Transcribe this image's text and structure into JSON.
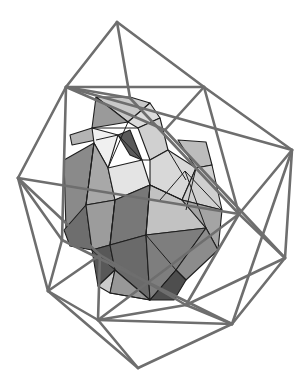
{
  "figure": {
    "background": "#ffffff",
    "wire_color": "#6e6e6e",
    "edge_color": "#1e1e1e"
  },
  "wireframe": {
    "vertices": {
      "A": [
        117,
        22
      ],
      "B": [
        66,
        87
      ],
      "C": [
        204,
        87
      ],
      "D": [
        292,
        150
      ],
      "E": [
        18,
        178
      ],
      "F": [
        239,
        214
      ],
      "G": [
        285,
        258
      ],
      "H": [
        48,
        291
      ],
      "I": [
        98,
        320
      ],
      "J": [
        186,
        305
      ],
      "K": [
        232,
        324
      ],
      "L": [
        138,
        368
      ],
      "P": [
        130,
        98
      ],
      "Q": [
        165,
        130
      ],
      "R": [
        62,
        240
      ],
      "S": [
        100,
        255
      ]
    },
    "edges": [
      [
        "A",
        "B"
      ],
      [
        "A",
        "C"
      ],
      [
        "A",
        "P"
      ],
      [
        "B",
        "C"
      ],
      [
        "C",
        "D"
      ],
      [
        "B",
        "E"
      ],
      [
        "B",
        "P"
      ],
      [
        "B",
        "Q"
      ],
      [
        "C",
        "Q"
      ],
      [
        "C",
        "F"
      ],
      [
        "D",
        "F"
      ],
      [
        "D",
        "G"
      ],
      [
        "D",
        "K"
      ],
      [
        "E",
        "H"
      ],
      [
        "E",
        "R"
      ],
      [
        "B",
        "R"
      ],
      [
        "E",
        "S"
      ],
      [
        "H",
        "I"
      ],
      [
        "H",
        "L"
      ],
      [
        "H",
        "S"
      ],
      [
        "I",
        "J"
      ],
      [
        "I",
        "K"
      ],
      [
        "J",
        "K"
      ],
      [
        "J",
        "G"
      ],
      [
        "K",
        "L"
      ],
      [
        "I",
        "L"
      ],
      [
        "G",
        "K"
      ],
      [
        "F",
        "G"
      ],
      [
        "F",
        "I"
      ],
      [
        "F",
        "J"
      ],
      [
        "R",
        "H"
      ],
      [
        "S",
        "J"
      ],
      [
        "Q",
        "G"
      ],
      [
        "P",
        "F"
      ],
      [
        "B",
        "D"
      ],
      [
        "E",
        "F"
      ],
      [
        "R",
        "K"
      ],
      [
        "S",
        "I"
      ]
    ]
  },
  "inner": {
    "facets": [
      {
        "pts": [
          [
            96,
            97
          ],
          [
            130,
            97
          ],
          [
            150,
            103
          ],
          [
            128,
            122
          ]
        ],
        "fill": "#c8c8c8"
      },
      {
        "pts": [
          [
            96,
            97
          ],
          [
            92,
            128
          ],
          [
            128,
            122
          ]
        ],
        "fill": "#9a9a9a"
      },
      {
        "pts": [
          [
            128,
            122
          ],
          [
            150,
            103
          ],
          [
            160,
            118
          ],
          [
            138,
            128
          ]
        ],
        "fill": "#dcdcdc"
      },
      {
        "pts": [
          [
            72,
            145
          ],
          [
            96,
            140
          ],
          [
            92,
            128
          ],
          [
            70,
            135
          ]
        ],
        "fill": "#b4b4b4"
      },
      {
        "pts": [
          [
            118,
            135
          ],
          [
            130,
            155
          ],
          [
            142,
            160
          ],
          [
            130,
            130
          ]
        ],
        "fill": "#5a5a5a"
      },
      {
        "pts": [
          [
            92,
            128
          ],
          [
            118,
            135
          ],
          [
            108,
            168
          ],
          [
            94,
            143
          ]
        ],
        "fill": "#f0f0f0"
      },
      {
        "pts": [
          [
            138,
            128
          ],
          [
            160,
            118
          ],
          [
            168,
            150
          ],
          [
            150,
            160
          ]
        ],
        "fill": "#d0d0d0"
      },
      {
        "pts": [
          [
            64,
            160
          ],
          [
            94,
            143
          ],
          [
            86,
            205
          ],
          [
            66,
            230
          ]
        ],
        "fill": "#8a8a8a"
      },
      {
        "pts": [
          [
            94,
            143
          ],
          [
            108,
            168
          ],
          [
            115,
            200
          ],
          [
            86,
            205
          ]
        ],
        "fill": "#a8a8a8"
      },
      {
        "pts": [
          [
            108,
            168
          ],
          [
            142,
            160
          ],
          [
            150,
            185
          ],
          [
            115,
            200
          ]
        ],
        "fill": "#e4e4e4"
      },
      {
        "pts": [
          [
            150,
            160
          ],
          [
            168,
            150
          ],
          [
            196,
            168
          ],
          [
            182,
            200
          ],
          [
            150,
            185
          ]
        ],
        "fill": "#d8d8d8"
      },
      {
        "pts": [
          [
            178,
            140
          ],
          [
            206,
            142
          ],
          [
            212,
            165
          ],
          [
            196,
            168
          ]
        ],
        "fill": "#bcbcbc"
      },
      {
        "pts": [
          [
            196,
            168
          ],
          [
            212,
            165
          ],
          [
            222,
            210
          ],
          [
            182,
            200
          ]
        ],
        "fill": "#cfcfcf"
      },
      {
        "pts": [
          [
            64,
            230
          ],
          [
            86,
            205
          ],
          [
            92,
            250
          ],
          [
            70,
            246
          ]
        ],
        "fill": "#6e6e6e"
      },
      {
        "pts": [
          [
            86,
            205
          ],
          [
            115,
            200
          ],
          [
            110,
            245
          ],
          [
            92,
            250
          ]
        ],
        "fill": "#9c9c9c"
      },
      {
        "pts": [
          [
            115,
            200
          ],
          [
            150,
            185
          ],
          [
            146,
            235
          ],
          [
            110,
            245
          ]
        ],
        "fill": "#787878"
      },
      {
        "pts": [
          [
            150,
            185
          ],
          [
            182,
            200
          ],
          [
            206,
            228
          ],
          [
            146,
            235
          ]
        ],
        "fill": "#c2c2c2"
      },
      {
        "pts": [
          [
            182,
            200
          ],
          [
            222,
            210
          ],
          [
            218,
            250
          ],
          [
            206,
            228
          ]
        ],
        "fill": "#a4a4a4"
      },
      {
        "pts": [
          [
            92,
            250
          ],
          [
            110,
            245
          ],
          [
            115,
            270
          ],
          [
            98,
            286
          ]
        ],
        "fill": "#585858"
      },
      {
        "pts": [
          [
            110,
            245
          ],
          [
            146,
            235
          ],
          [
            150,
            300
          ],
          [
            115,
            270
          ]
        ],
        "fill": "#6a6a6a"
      },
      {
        "pts": [
          [
            146,
            235
          ],
          [
            206,
            228
          ],
          [
            176,
            270
          ],
          [
            150,
            300
          ]
        ],
        "fill": "#7e7e7e"
      },
      {
        "pts": [
          [
            206,
            228
          ],
          [
            218,
            250
          ],
          [
            186,
            280
          ],
          [
            176,
            270
          ]
        ],
        "fill": "#8c8c8c"
      },
      {
        "pts": [
          [
            98,
            286
          ],
          [
            115,
            270
          ],
          [
            110,
            293
          ]
        ],
        "fill": "#cacaca"
      },
      {
        "pts": [
          [
            115,
            270
          ],
          [
            150,
            300
          ],
          [
            110,
            293
          ]
        ],
        "fill": "#989898"
      },
      {
        "pts": [
          [
            176,
            270
          ],
          [
            186,
            280
          ],
          [
            174,
            300
          ],
          [
            150,
            300
          ]
        ],
        "fill": "#4e4e4e"
      }
    ],
    "edges": [
      [
        [
          96,
          140
        ],
        [
          118,
          135
        ]
      ],
      [
        [
          118,
          135
        ],
        [
          142,
          160
        ]
      ],
      [
        [
          92,
          128
        ],
        [
          138,
          128
        ]
      ],
      [
        [
          108,
          168
        ],
        [
          128,
          122
        ]
      ],
      [
        [
          150,
          160
        ],
        [
          142,
          160
        ]
      ],
      [
        [
          168,
          150
        ],
        [
          186,
          180
        ]
      ],
      [
        [
          182,
          200
        ],
        [
          150,
          185
        ]
      ],
      [
        [
          196,
          168
        ],
        [
          186,
          210
        ]
      ],
      [
        [
          86,
          205
        ],
        [
          94,
          143
        ]
      ],
      [
        [
          110,
          245
        ],
        [
          115,
          200
        ]
      ],
      [
        [
          146,
          235
        ],
        [
          150,
          185
        ]
      ],
      [
        [
          146,
          235
        ],
        [
          176,
          270
        ]
      ],
      [
        [
          176,
          270
        ],
        [
          150,
          300
        ]
      ],
      [
        [
          92,
          250
        ],
        [
          115,
          270
        ]
      ],
      [
        [
          110,
          293
        ],
        [
          150,
          300
        ]
      ],
      [
        [
          185,
          171
        ],
        [
          222,
          210
        ]
      ],
      [
        [
          185,
          171
        ],
        [
          206,
          228
        ]
      ],
      [
        [
          185,
          171
        ],
        [
          160,
          200
        ]
      ]
    ]
  }
}
